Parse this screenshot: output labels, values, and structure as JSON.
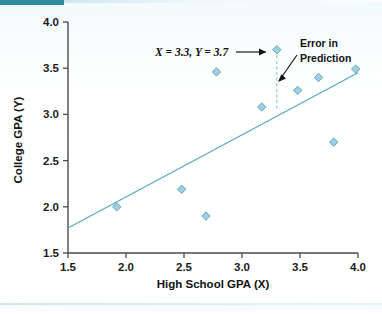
{
  "figure": {
    "background_color": "#ffffff",
    "accent_color": "#2e8a9c",
    "marker_color": "#9ecfe0",
    "marker_edge_color": "#5c9fb4",
    "line_color": "#5aa8c0",
    "error_line_color": "#8ec9da"
  },
  "chart_data": {
    "type": "scatter",
    "title": "",
    "xlabel": "High School GPA (X)",
    "ylabel": "College GPA (Y)",
    "xlim": [
      1.5,
      4.0
    ],
    "ylim": [
      1.5,
      4.0
    ],
    "xticks": [
      "1.5",
      "2.0",
      "2.5",
      "3.0",
      "3.5",
      "4.0"
    ],
    "xtick_values": [
      1.5,
      2.0,
      2.5,
      3.0,
      3.5,
      4.0
    ],
    "yticks": [
      "1.5",
      "2.0",
      "2.5",
      "3.0",
      "3.5",
      "4.0"
    ],
    "ytick_values": [
      1.5,
      2.0,
      2.5,
      3.0,
      3.5,
      4.0
    ],
    "grid": false,
    "legend": null,
    "points": [
      {
        "x": 1.92,
        "y": 2.0
      },
      {
        "x": 2.48,
        "y": 2.19
      },
      {
        "x": 2.69,
        "y": 1.9
      },
      {
        "x": 2.78,
        "y": 3.46
      },
      {
        "x": 3.17,
        "y": 3.08
      },
      {
        "x": 3.3,
        "y": 3.7,
        "label": "highlighted"
      },
      {
        "x": 3.48,
        "y": 3.26
      },
      {
        "x": 3.66,
        "y": 3.4
      },
      {
        "x": 3.79,
        "y": 2.7
      },
      {
        "x": 3.98,
        "y": 3.49
      }
    ],
    "regression_line": {
      "x_start": 1.5,
      "y_start": 1.77,
      "x_end": 4.0,
      "y_end": 3.45
    },
    "error_segment": {
      "x": 3.3,
      "y_top": 3.7,
      "y_bottom": 3.06
    },
    "annotations": [
      {
        "name": "point-coordinates",
        "text": "X = 3.3, Y = 3.7",
        "text_x": 2.28,
        "text_y": 3.7,
        "points_to_x": 3.3,
        "points_to_y": 3.7
      },
      {
        "name": "error-in-prediction",
        "line1": "Error in",
        "line2": "Prediction",
        "text_x": 3.54,
        "text_y": 3.82,
        "points_to_x": 3.3,
        "points_to_y": 3.3
      }
    ]
  }
}
